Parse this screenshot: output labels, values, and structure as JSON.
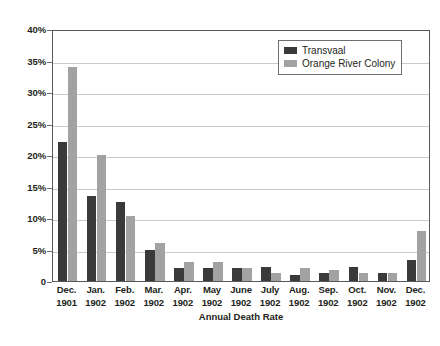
{
  "chart_data": {
    "type": "bar",
    "title": "",
    "xlabel": "Annual Death Rate",
    "ylabel": "",
    "ylim": [
      0,
      40
    ],
    "ytick_values": [
      0,
      5,
      10,
      15,
      20,
      25,
      30,
      35,
      40
    ],
    "ytick_labels": [
      "0",
      "5%",
      "10%",
      "15%",
      "20%",
      "25%",
      "30%",
      "35%",
      "40%"
    ],
    "grid": true,
    "legend_position": "top-right",
    "categories": [
      "Dec. 1901",
      "Jan. 1902",
      "Feb. 1902",
      "Mar. 1902",
      "Apr. 1902",
      "May 1902",
      "June 1902",
      "July 1902",
      "Aug. 1902",
      "Sep. 1902",
      "Oct. 1902",
      "Nov. 1902",
      "Dec. 1902"
    ],
    "category_lines": [
      [
        "Dec.",
        "1901"
      ],
      [
        "Jan.",
        "1902"
      ],
      [
        "Feb.",
        "1902"
      ],
      [
        "Mar.",
        "1902"
      ],
      [
        "Apr.",
        "1902"
      ],
      [
        "May",
        "1902"
      ],
      [
        "June",
        "1902"
      ],
      [
        "July",
        "1902"
      ],
      [
        "Aug.",
        "1902"
      ],
      [
        "Sep.",
        "1902"
      ],
      [
        "Oct.",
        "1902"
      ],
      [
        "Nov.",
        "1902"
      ],
      [
        "Dec.",
        "1902"
      ]
    ],
    "series": [
      {
        "name": "Transvaal",
        "color": "#3a3a3a",
        "values": [
          22.0,
          13.5,
          12.5,
          5.0,
          2.0,
          2.1,
          2.0,
          2.2,
          1.0,
          1.2,
          2.2,
          1.3,
          3.3
        ]
      },
      {
        "name": "Orange River Colony",
        "color": "#a2a2a2",
        "values": [
          34.0,
          20.0,
          10.3,
          6.0,
          3.0,
          3.0,
          2.0,
          1.2,
          2.0,
          1.8,
          1.2,
          1.3,
          8.0
        ]
      }
    ]
  },
  "legend": {
    "entries": [
      {
        "label": "Transvaal"
      },
      {
        "label": "Orange River Colony"
      }
    ]
  }
}
